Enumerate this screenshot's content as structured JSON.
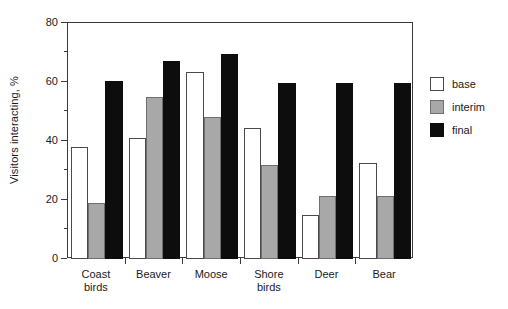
{
  "chart_data": {
    "type": "bar",
    "title": "",
    "xlabel": "",
    "ylabel": "Visitors interacting, %",
    "ylim": [
      0,
      80
    ],
    "yticks": [
      0,
      20,
      40,
      60,
      80
    ],
    "yticks_minor": [
      10,
      30,
      50,
      70
    ],
    "grid": false,
    "legend_position": "right",
    "categories": [
      "Coast birds",
      "Beaver",
      "Moose",
      "Shore birds",
      "Deer",
      "Bear"
    ],
    "series": [
      {
        "name": "base",
        "color": "#ffffff",
        "values": [
          38,
          41,
          63.5,
          44.5,
          15,
          32.5
        ]
      },
      {
        "name": "interim",
        "color": "#a8a8a8",
        "values": [
          19,
          55,
          48,
          32,
          21.5,
          21.5
        ]
      },
      {
        "name": "final",
        "color": "#0d0d0d",
        "values": [
          60.5,
          67,
          69.5,
          59.5,
          59.5,
          59.5
        ]
      }
    ]
  },
  "axis": {
    "y_title": "Visitors interacting, %",
    "y_tick_labels": [
      "0",
      "20",
      "40",
      "60",
      "80"
    ]
  },
  "legend": {
    "items": [
      {
        "label": "base"
      },
      {
        "label": "interim"
      },
      {
        "label": "final"
      }
    ]
  },
  "colors": {
    "base": "#ffffff",
    "interim": "#a8a8a8",
    "final": "#0d0d0d",
    "axis": "#3a3a3a"
  }
}
